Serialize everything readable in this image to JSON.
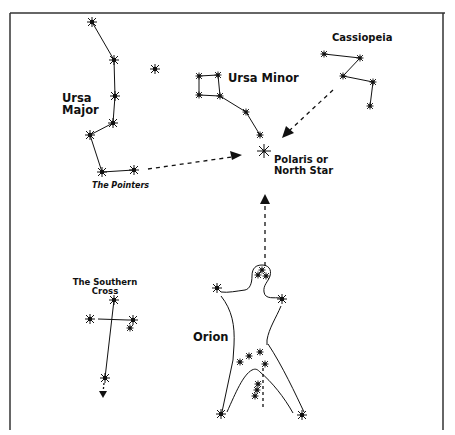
{
  "figure": {
    "colors": {
      "ink": "#111111",
      "background": "#ffffff",
      "border": "#333333"
    }
  },
  "labels": {
    "ursa_major": "Ursa\nMajor",
    "ursa_major_line1": "Ursa",
    "ursa_major_line2": "Major",
    "the_pointers": "The Pointers",
    "ursa_minor": "Ursa Minor",
    "cassiopeia": "Cassiopeia",
    "polaris_line1": "Polaris or",
    "polaris_line2": "North Star",
    "southern_cross_line1": "The Southern",
    "southern_cross_line2": "Cross",
    "orion": "Orion"
  },
  "constellations": [
    {
      "name": "Ursa Major",
      "stars": [
        [
          92,
          22
        ],
        [
          114,
          60
        ],
        [
          115,
          96
        ],
        [
          113,
          123
        ],
        [
          90,
          135
        ],
        [
          102,
          172
        ],
        [
          134,
          170
        ]
      ]
    },
    {
      "name": "Ursa Minor",
      "stars": [
        [
          199,
          76
        ],
        [
          218,
          75
        ],
        [
          199,
          95
        ],
        [
          220,
          96
        ],
        [
          246,
          112
        ],
        [
          260,
          135
        ],
        [
          264,
          151
        ]
      ]
    },
    {
      "name": "Cassiopeia",
      "stars": [
        [
          324,
          54
        ],
        [
          360,
          58
        ],
        [
          343,
          76
        ],
        [
          373,
          82
        ],
        [
          370,
          106
        ]
      ]
    },
    {
      "name": "The Southern Cross",
      "stars": [
        [
          114,
          300
        ],
        [
          90,
          319
        ],
        [
          133,
          320
        ],
        [
          130,
          328
        ],
        [
          105,
          378
        ]
      ]
    },
    {
      "name": "Orion",
      "stars": [
        [
          262,
          272
        ],
        [
          258,
          276
        ],
        [
          266,
          276
        ],
        [
          217,
          288
        ],
        [
          282,
          299
        ],
        [
          260,
          352
        ],
        [
          249,
          356
        ],
        [
          240,
          363
        ],
        [
          265,
          364
        ],
        [
          258,
          384
        ],
        [
          257,
          390
        ],
        [
          255,
          396
        ],
        [
          221,
          414
        ],
        [
          302,
          415
        ]
      ]
    }
  ],
  "isolated_stars": [
    [
      155,
      69
    ]
  ],
  "pointers": [
    {
      "from": "The Pointers",
      "to": "Polaris",
      "style": "dotted-arrow"
    },
    {
      "from": "Cassiopeia",
      "to": "Polaris",
      "style": "dotted-arrow"
    },
    {
      "from": "Orion",
      "to": "Polaris",
      "style": "dotted-arrow"
    },
    {
      "from": "The Southern Cross",
      "to": "south",
      "style": "dotted-arrow"
    }
  ]
}
